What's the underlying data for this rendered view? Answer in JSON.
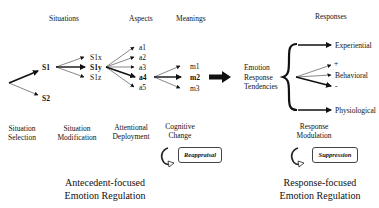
{
  "headers": {
    "situations": "Situations",
    "aspects": "Aspects",
    "meanings": "Meanings",
    "responses": "Responses"
  },
  "situations": {
    "s1": "S1",
    "s2": "S2",
    "s1x": "S1x",
    "s1y": "S1y",
    "s1z": "S1z"
  },
  "aspects": [
    "a1",
    "a2",
    "a3",
    "a4",
    "a5"
  ],
  "meanings": [
    "m1",
    "m2",
    "m3"
  ],
  "tendencies": [
    "Emotion",
    "Response",
    "Tendencies"
  ],
  "responses": {
    "experiential": "Experiential",
    "plus": "+",
    "behavioral": "Behavioral",
    "minus": "-",
    "physiological": "Physiological"
  },
  "stages": {
    "situation_selection": [
      "Situation",
      "Selection"
    ],
    "situation_modification": [
      "Situation",
      "Modification"
    ],
    "attentional_deployment": [
      "Attentional",
      "Deployment"
    ],
    "cognitive_change": [
      "Cognitive",
      "Change"
    ],
    "response_modulation": [
      "Response",
      "Modulation"
    ]
  },
  "strategies": {
    "reappraisal": "Reappraisal",
    "suppression": "Suppression"
  },
  "groups": {
    "antecedent": [
      "Antecedent-focused",
      "Emotion Regulation"
    ],
    "response": [
      "Response-focused",
      "Emotion Regulation"
    ]
  }
}
